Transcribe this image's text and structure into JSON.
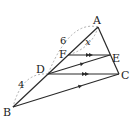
{
  "diagram": {
    "points": {
      "A": {
        "label": "A",
        "x": 98,
        "y": 27,
        "lx": 93,
        "ly": 24
      },
      "B": {
        "label": "B",
        "x": 13,
        "y": 107,
        "lx": 3,
        "ly": 116
      },
      "C": {
        "label": "C",
        "x": 119,
        "y": 74,
        "lx": 121,
        "ly": 79
      },
      "D": {
        "label": "D",
        "x": 48,
        "y": 74,
        "lx": 36,
        "ly": 73
      },
      "E": {
        "label": "E",
        "x": 110,
        "y": 55,
        "lx": 112,
        "ly": 62
      },
      "F": {
        "label": "F",
        "x": 68,
        "y": 55,
        "lx": 59,
        "ly": 58
      }
    },
    "segments": [
      "AB",
      "AC",
      "BC",
      "DC",
      "DE",
      "FE"
    ],
    "parallel_marks": {
      "double": [
        "FE",
        "DC"
      ],
      "single": [
        "DE",
        "BC"
      ]
    },
    "measures": {
      "AD": {
        "label": "6",
        "x": 60,
        "y": 44
      },
      "DB": {
        "label": "4",
        "x": 18,
        "y": 88
      },
      "AF": {
        "label": "x",
        "x": 85,
        "y": 45
      }
    },
    "colors": {
      "line": "#2a2a2a",
      "dashed": "#9a9a9a"
    }
  }
}
